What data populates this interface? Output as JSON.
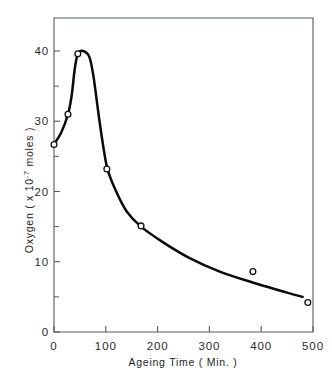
{
  "chart_data": {
    "type": "line",
    "title": "",
    "xlabel": "Ageing Time ( Min. )",
    "ylabel": "Oxygen ( x 10",
    "ylabel_exponent": "-7",
    "ylabel_tail": "moles )",
    "xlim": [
      0,
      500
    ],
    "ylim": [
      0,
      43
    ],
    "xticks": [
      0,
      100,
      200,
      300,
      400,
      500
    ],
    "xticklabels": [
      "0",
      "100",
      "200",
      "300",
      "400",
      "500"
    ],
    "yticks": [
      0,
      10,
      20,
      30,
      40
    ],
    "yticklabels": [
      "0",
      "10",
      "20",
      "30",
      "40"
    ],
    "y_minor_ticks": [
      5,
      15,
      25,
      35
    ],
    "grid": false,
    "legend": false,
    "marker_style": "open-circle",
    "line_color": "#0a0a0a",
    "marker_face_color": "#ffffff",
    "marker_edge_color": "#111111",
    "series": [
      {
        "name": "Oxygen uptake vs ageing time",
        "x": [
          0,
          27,
          46,
          102,
          168,
          384,
          490
        ],
        "y": [
          26.7,
          31.0,
          39.6,
          23.2,
          15.1,
          8.6,
          4.2
        ]
      }
    ],
    "curve_points": [
      {
        "x": 0,
        "y": 26.7
      },
      {
        "x": 14,
        "y": 28.4
      },
      {
        "x": 27,
        "y": 31.0
      },
      {
        "x": 34,
        "y": 33.6
      },
      {
        "x": 40,
        "y": 37.4
      },
      {
        "x": 46,
        "y": 39.6
      },
      {
        "x": 56,
        "y": 40.0
      },
      {
        "x": 68,
        "y": 39.2
      },
      {
        "x": 76,
        "y": 36.5
      },
      {
        "x": 86,
        "y": 31.0
      },
      {
        "x": 96,
        "y": 26.0
      },
      {
        "x": 104,
        "y": 23.0
      },
      {
        "x": 120,
        "y": 20.0
      },
      {
        "x": 140,
        "y": 17.2
      },
      {
        "x": 168,
        "y": 15.0
      },
      {
        "x": 210,
        "y": 12.8
      },
      {
        "x": 260,
        "y": 10.6
      },
      {
        "x": 320,
        "y": 8.6
      },
      {
        "x": 390,
        "y": 6.9
      },
      {
        "x": 450,
        "y": 5.6
      },
      {
        "x": 480,
        "y": 5.0
      }
    ],
    "annotations": []
  },
  "figure": {
    "background_color": "#ffffff",
    "frame_color": "#555c60"
  }
}
